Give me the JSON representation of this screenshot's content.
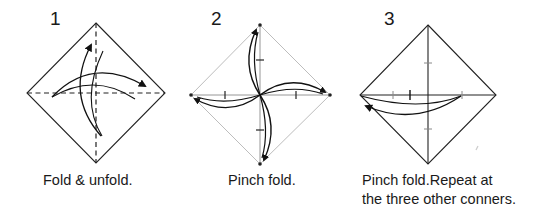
{
  "steps": [
    {
      "number": "1",
      "caption": "Fold & unfold."
    },
    {
      "number": "2",
      "caption": "Pinch fold."
    },
    {
      "number": "3",
      "caption_line1": "Pinch fold.Repeat at",
      "caption_line2": "the three other conners."
    }
  ],
  "colors": {
    "ink": "#1a1a1a",
    "light_line": "#b5b5b5",
    "background": "#ffffff"
  }
}
